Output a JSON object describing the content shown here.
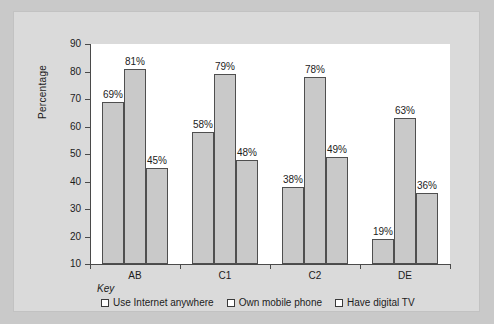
{
  "chart_data": {
    "type": "bar",
    "title": "",
    "xlabel": "",
    "ylabel": "Percentage",
    "ylim": [
      10,
      90
    ],
    "ytick_step": 10,
    "grid": false,
    "legend_position": "bottom",
    "categories": [
      "AB",
      "C1",
      "C2",
      "DE"
    ],
    "yticks": [
      "90",
      "80",
      "70",
      "60",
      "50",
      "40",
      "30",
      "20",
      "10"
    ],
    "series": [
      {
        "name": "Use Internet anywhere",
        "values": [
          69,
          58,
          38,
          19
        ],
        "labels": [
          "69%",
          "58%",
          "38%",
          "19%"
        ]
      },
      {
        "name": "Own mobile phone",
        "values": [
          81,
          79,
          78,
          63
        ],
        "labels": [
          "81%",
          "79%",
          "78%",
          "63%"
        ]
      },
      {
        "name": "Have digital TV",
        "values": [
          45,
          48,
          49,
          36
        ],
        "labels": [
          "45%",
          "48%",
          "49%",
          "36%"
        ]
      }
    ],
    "colors": {
      "bar_fill": "#c9c9c9",
      "bar_stroke": "#4f4f4f",
      "axis": "#4a4a4a",
      "plot_background": "#ffffff",
      "panel_background": "#dadada",
      "page_background": "#c9c9c9",
      "text": "#1c1c1c"
    }
  },
  "key": {
    "title": "Key",
    "items": [
      {
        "label": "Use Internet anywhere"
      },
      {
        "label": "Own mobile phone"
      },
      {
        "label": "Have digital TV"
      }
    ]
  }
}
